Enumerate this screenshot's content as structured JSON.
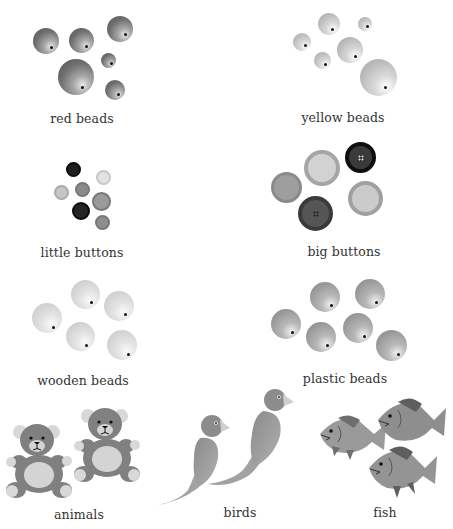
{
  "categories": [
    {
      "id": "red-beads",
      "label": "red beads"
    },
    {
      "id": "yellow-beads",
      "label": "yellow beads"
    },
    {
      "id": "little-buttons",
      "label": "little buttons"
    },
    {
      "id": "big-buttons",
      "label": "big buttons"
    },
    {
      "id": "wooden-beads",
      "label": "wooden beads"
    },
    {
      "id": "plastic-beads",
      "label": "plastic beads"
    },
    {
      "id": "animals",
      "label": "animals"
    },
    {
      "id": "birds",
      "label": "birds"
    },
    {
      "id": "fish",
      "label": "fish"
    }
  ],
  "icons": {
    "bead": "bead-icon",
    "button": "button-icon",
    "bear": "teddy-bear-icon",
    "bird": "bird-icon",
    "fish": "fish-icon"
  },
  "colors": {
    "background": "#ffffff",
    "label_text": "#333333",
    "bear_body": "#808080",
    "bear_belly": "#d4d4d4",
    "bird": "#9a9a9a",
    "fish": "#8c8c8c"
  }
}
